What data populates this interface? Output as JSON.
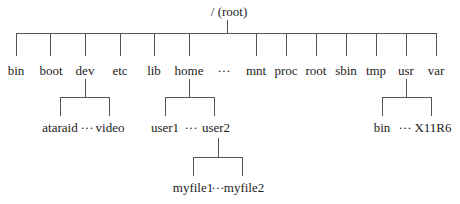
{
  "diagram": {
    "root": "/ (root)",
    "top_level": [
      "bin",
      "boot",
      "dev",
      "etc",
      "lib",
      "home",
      "···",
      "mnt",
      "proc",
      "root",
      "sbin",
      "tmp",
      "usr",
      "var"
    ],
    "dev_children": {
      "left": "ataraid",
      "ellipsis": "···",
      "right": "video"
    },
    "home_children": {
      "left": "user1",
      "ellipsis": "···",
      "right": "user2"
    },
    "user2_children": {
      "left": "myfile1",
      "ellipsis": "···",
      "right": "myfile2"
    },
    "usr_children": {
      "left": "bin",
      "ellipsis": "···",
      "right": "X11R6"
    },
    "line_color": "#555555"
  }
}
